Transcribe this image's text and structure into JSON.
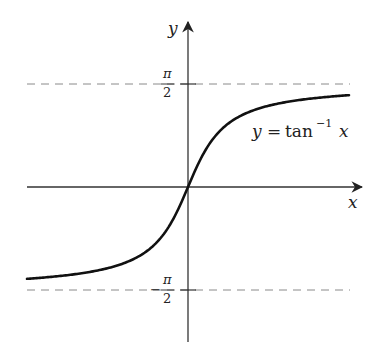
{
  "chart_data": {
    "type": "line",
    "title": "",
    "function": "arctan",
    "curve_label": {
      "lhs": "y",
      "eq": "=",
      "fn": "tan",
      "sup": "−1",
      "arg": "x"
    },
    "xlabel": "x",
    "ylabel": "y",
    "asymptotes": [
      {
        "value": 1.5708,
        "label_num": "π",
        "label_den": "2",
        "label_sign": "",
        "style": "dashed"
      },
      {
        "value": -1.5708,
        "label_num": "π",
        "label_den": "2",
        "label_sign": "−",
        "style": "dashed"
      }
    ],
    "x": [
      -5.8,
      -5,
      -4,
      -3,
      -2,
      -1.5,
      -1,
      -0.5,
      0,
      0.5,
      1,
      1.5,
      2,
      3,
      4,
      5,
      5.8
    ],
    "y": [
      -1.4,
      -1.3734,
      -1.3258,
      -1.249,
      -1.1071,
      -0.9828,
      -0.7854,
      -0.4636,
      0,
      0.4636,
      0.7854,
      0.9828,
      1.1071,
      1.249,
      1.3258,
      1.3734,
      1.4
    ],
    "xlim": [
      -5.8,
      5.8
    ],
    "ylim": [
      -1.5708,
      1.5708
    ],
    "grid": false,
    "legend": "none",
    "colors": {
      "curve": "#111111",
      "axis": "#333333",
      "asymptote": "#888888"
    }
  }
}
